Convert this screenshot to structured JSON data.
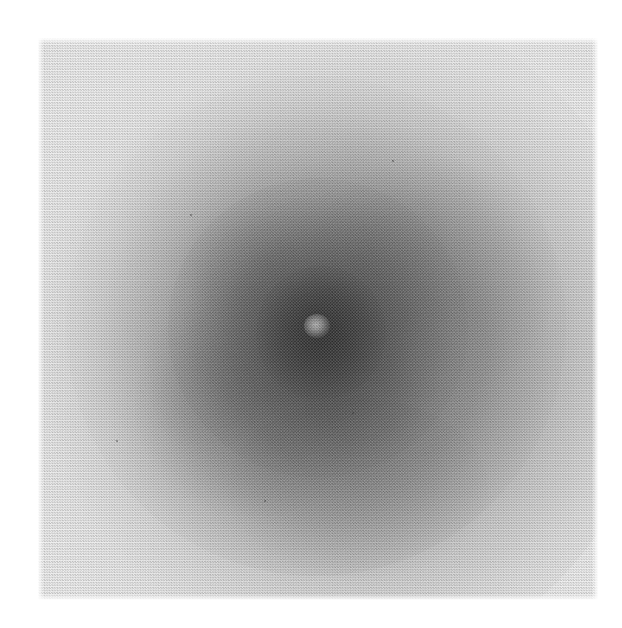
{
  "figure": {
    "kind": "photographic-plate-image",
    "medium": "halftone print reproduction",
    "caption": "",
    "page_background": "#ffffff",
    "plate_background": "#efefef"
  },
  "plate": {
    "left": 38,
    "top": 38,
    "width": 560,
    "height": 562,
    "edge_note": "soft feathered scan edges against white paper"
  },
  "chart_data": {
    "type": "heatmap",
    "title": "",
    "subtitle": "",
    "xlabel": "",
    "ylabel": "",
    "grid": false,
    "legend": "none",
    "colormap": "grayscale-inverted (dark = bright source)",
    "axis_ranges": {
      "x_px": [
        0,
        560
      ],
      "y_px": [
        0,
        562
      ]
    },
    "value_scale": {
      "unit": "relative optical density",
      "min": 0.0,
      "max": 1.0,
      "background_level": 0.06
    },
    "structures": [
      {
        "name": "outer-halo",
        "center_px": [
          318,
          322
        ],
        "radius_px": 260,
        "density": 0.18,
        "gray_hex": "#c9c9c9"
      },
      {
        "name": "mid-envelope",
        "center_px": [
          300,
          330
        ],
        "radius_px": 180,
        "density": 0.38,
        "gray_hex": "#a0a0a0"
      },
      {
        "name": "inner-envelope",
        "center_px": [
          305,
          332
        ],
        "radius_px": 110,
        "density": 0.58,
        "gray_hex": "#7e7e7e"
      },
      {
        "name": "dark-core",
        "center_px": [
          310,
          336
        ],
        "radius_px": 55,
        "density": 0.8,
        "gray_hex": "#5f5f5f"
      },
      {
        "name": "bright-nucleus-knot",
        "center_px": [
          318,
          326
        ],
        "radius_px": 12,
        "density": 0.34,
        "gray_hex": "#8f8f8f"
      },
      {
        "name": "lobe-northeast",
        "center_px": [
          432,
          278
        ],
        "radius_px": 120,
        "density": 0.42,
        "gray_hex": "#9a9a9a"
      },
      {
        "name": "lobe-southwest",
        "center_px": [
          254,
          402
        ],
        "radius_px": 115,
        "density": 0.45,
        "gray_hex": "#949494"
      },
      {
        "name": "lobe-south",
        "center_px": [
          358,
          486
        ],
        "radius_px": 110,
        "density": 0.4,
        "gray_hex": "#9d9d9d"
      }
    ],
    "radial_profile": {
      "r_px": [
        0,
        15,
        30,
        55,
        80,
        110,
        140,
        170,
        200,
        230,
        260,
        290
      ],
      "gray_hex": [
        "#6a6a6a",
        "#5f5f5f",
        "#636363",
        "#6e6e6e",
        "#7c7c7c",
        "#8b8b8b",
        "#9c9c9c",
        "#afafaf",
        "#c2c2c2",
        "#d4d4d4",
        "#e2e2e2",
        "#ececec"
      ],
      "density": [
        0.72,
        0.8,
        0.77,
        0.7,
        0.62,
        0.52,
        0.42,
        0.32,
        0.22,
        0.13,
        0.07,
        0.04
      ]
    },
    "texture": {
      "pattern": "halftone screen dots",
      "cell_px": 2.6,
      "note": "fine checkerboard dot screen visible across the whole plate"
    }
  },
  "specks": [
    {
      "x": 264,
      "y": 500,
      "d": 2
    },
    {
      "x": 116,
      "y": 440,
      "d": 2
    },
    {
      "x": 392,
      "y": 160,
      "d": 2
    },
    {
      "x": 190,
      "y": 214,
      "d": 2
    },
    {
      "x": 352,
      "y": 412,
      "d": 2
    }
  ]
}
